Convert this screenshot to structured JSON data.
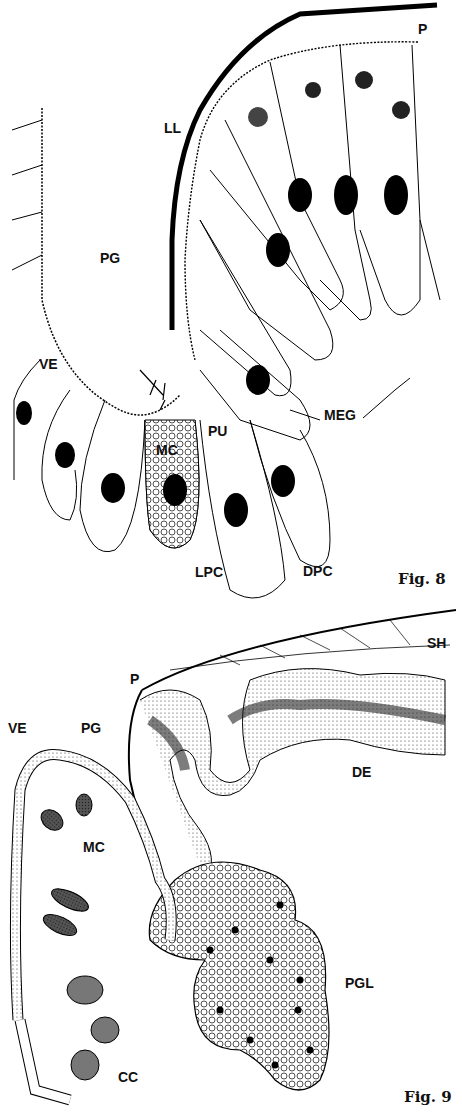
{
  "fig8": {
    "caption": "Fig. 8",
    "labels": {
      "P": "P",
      "LL": "LL",
      "PG": "PG",
      "VE": "VE",
      "MC": "MC",
      "PU": "PU",
      "MEG": "MEG",
      "LPC": "LPC",
      "DPC": "DPC"
    }
  },
  "fig9": {
    "caption": "Fig. 9",
    "labels": {
      "SH": "SH",
      "P": "P",
      "VE": "VE",
      "PG": "PG",
      "DE": "DE",
      "MC": "MC",
      "PGL": "PGL",
      "CC": "CC"
    }
  }
}
